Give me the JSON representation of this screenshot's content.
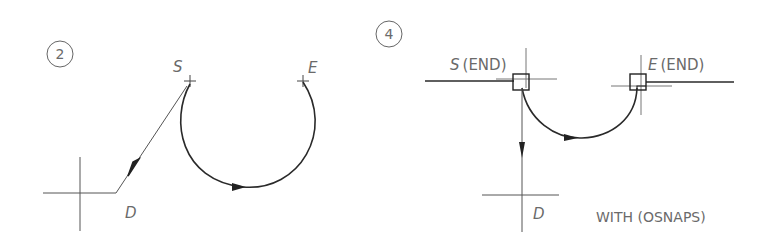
{
  "panels": [
    {
      "number": "2",
      "start_label": "S",
      "end_label": "E",
      "direction_label": "D"
    },
    {
      "number": "4",
      "start_label": "S",
      "start_snap": "(END)",
      "end_label": "E",
      "end_snap": "(END)",
      "direction_label": "D",
      "caption": "WITH (OSNAPS)"
    }
  ],
  "colors": {
    "line": "#2a2a2a",
    "thin": "#555555",
    "text": "#6a6a6a"
  }
}
